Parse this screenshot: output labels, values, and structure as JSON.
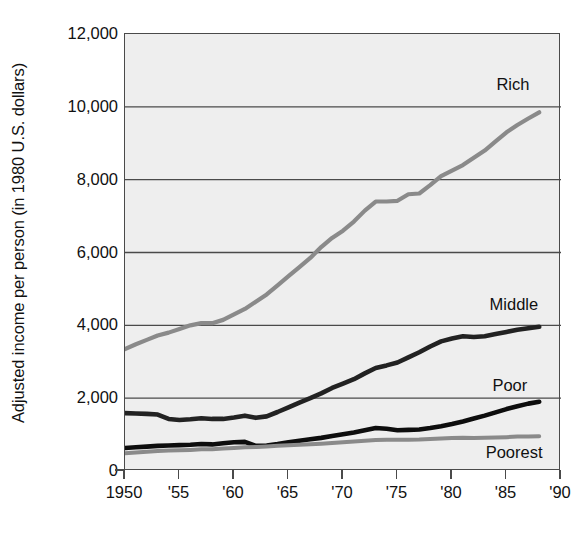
{
  "chart_data": {
    "type": "line",
    "title": "",
    "subtitle": "",
    "xlabel": "",
    "ylabel": "Adjusted income per person (in 1980 U.S. dollars)",
    "xlim": [
      1950,
      1990
    ],
    "ylim": [
      0,
      12000
    ],
    "grid": "horizontal",
    "legend_position": "inline-right-annotations",
    "x_tick_labels": [
      "1950",
      "'55",
      "'60",
      "'65",
      "'70",
      "'75",
      "'80",
      "'85",
      "'90"
    ],
    "x_tick_values": [
      1950,
      1955,
      1960,
      1965,
      1970,
      1975,
      1980,
      1985,
      1990
    ],
    "y_tick_labels": [
      "0",
      "2,000",
      "4,000",
      "6,000",
      "8,000",
      "10,000",
      "12,000"
    ],
    "y_tick_values": [
      0,
      2000,
      4000,
      6000,
      8000,
      10000,
      12000
    ],
    "x": [
      1950,
      1951,
      1952,
      1953,
      1954,
      1955,
      1956,
      1957,
      1958,
      1959,
      1960,
      1961,
      1962,
      1963,
      1964,
      1965,
      1966,
      1967,
      1968,
      1969,
      1970,
      1971,
      1972,
      1973,
      1974,
      1975,
      1976,
      1977,
      1978,
      1979,
      1980,
      1981,
      1982,
      1983,
      1984,
      1985,
      1986,
      1987,
      1988
    ],
    "series": [
      {
        "name": "Rich",
        "label": "Rich",
        "color": "#8a8a8a",
        "values": [
          3350,
          3480,
          3600,
          3720,
          3800,
          3900,
          4000,
          4060,
          4060,
          4150,
          4300,
          4450,
          4650,
          4850,
          5100,
          5350,
          5600,
          5850,
          6150,
          6400,
          6600,
          6850,
          7150,
          7400,
          7400,
          7420,
          7600,
          7620,
          7850,
          8100,
          8250,
          8400,
          8600,
          8800,
          9050,
          9300,
          9500,
          9680,
          9850
        ]
      },
      {
        "name": "Middle",
        "label": "Middle",
        "color": "#222222",
        "values": [
          1590,
          1580,
          1570,
          1550,
          1430,
          1400,
          1420,
          1450,
          1430,
          1430,
          1470,
          1520,
          1460,
          1500,
          1620,
          1750,
          1880,
          2000,
          2130,
          2280,
          2400,
          2520,
          2680,
          2830,
          2900,
          2980,
          3120,
          3260,
          3420,
          3560,
          3640,
          3700,
          3680,
          3700,
          3760,
          3820,
          3880,
          3920,
          3960
        ]
      },
      {
        "name": "Poor",
        "label": "Poor",
        "color": "#0d0d0d",
        "values": [
          630,
          650,
          670,
          690,
          700,
          710,
          720,
          740,
          730,
          760,
          790,
          800,
          690,
          700,
          740,
          790,
          830,
          870,
          910,
          960,
          1010,
          1060,
          1120,
          1180,
          1160,
          1120,
          1130,
          1140,
          1180,
          1230,
          1290,
          1360,
          1440,
          1520,
          1610,
          1700,
          1780,
          1850,
          1900
        ]
      },
      {
        "name": "Poorest",
        "label": "Poorest",
        "color": "#8a8a8a",
        "values": [
          490,
          510,
          530,
          550,
          560,
          570,
          580,
          595,
          600,
          615,
          630,
          650,
          660,
          675,
          690,
          705,
          720,
          735,
          750,
          770,
          790,
          810,
          830,
          850,
          855,
          855,
          860,
          865,
          880,
          895,
          905,
          910,
          905,
          910,
          920,
          930,
          945,
          950,
          955
        ]
      }
    ],
    "annotations": [
      {
        "text": "Rich",
        "x": 1987.2,
        "y": 10600
      },
      {
        "text": "Middle",
        "x": 1988.0,
        "y": 4550
      },
      {
        "text": "Poor",
        "x": 1987.0,
        "y": 2330
      },
      {
        "text": "Poorest",
        "x": 1988.4,
        "y": 500
      }
    ]
  }
}
